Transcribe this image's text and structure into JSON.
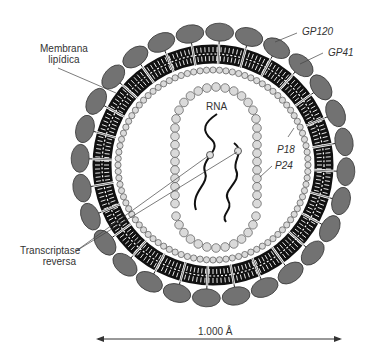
{
  "diagram": {
    "labels": {
      "membrane": [
        "Membrana",
        "lipídica"
      ],
      "gp120": "GP120",
      "gp41": "GP41",
      "rna": "RNA",
      "p18": "P18",
      "p24": "P24",
      "rt": [
        "Transcriptase",
        "reversa"
      ],
      "scale": "1.000 Å"
    },
    "components": [
      {
        "id": "gp120",
        "shape": "ellipse ring",
        "count": 28,
        "color": "#707070"
      },
      {
        "id": "membrane",
        "shape": "lipid bilayer ring",
        "color": "#111111"
      },
      {
        "id": "p18",
        "shape": "small bead ring",
        "color": "#d8d8d8"
      },
      {
        "id": "p24",
        "shape": "bead capsule",
        "color": "#d8d8d8"
      },
      {
        "id": "rna",
        "shape": "two wavy strands",
        "color": "#111111"
      },
      {
        "id": "rt",
        "shape": "small circles",
        "count": 2
      }
    ],
    "colors": {
      "gp120_fill": "#707070",
      "membrane": "#111111",
      "bead_fill": "#d9d9d9",
      "line": "#444444"
    }
  }
}
